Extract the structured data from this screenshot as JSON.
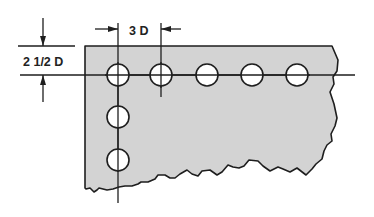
{
  "diagram": {
    "type": "rivet-hole spacing drawing",
    "plate_fill": "#d3d3d3",
    "line_color": "#1e1e1e",
    "hole_fill": "#ffffff",
    "dimensions": {
      "edge_distance_label": "2 1/2 D",
      "pitch_label": "3 D"
    },
    "holes": {
      "row": [
        {
          "cx": 118,
          "cy": 75
        },
        {
          "cx": 161,
          "cy": 75
        },
        {
          "cx": 207,
          "cy": 75
        },
        {
          "cx": 252,
          "cy": 75
        },
        {
          "cx": 297,
          "cy": 75
        }
      ],
      "column": [
        {
          "cx": 118,
          "cy": 117
        },
        {
          "cx": 118,
          "cy": 160
        }
      ],
      "radius": 11
    }
  }
}
